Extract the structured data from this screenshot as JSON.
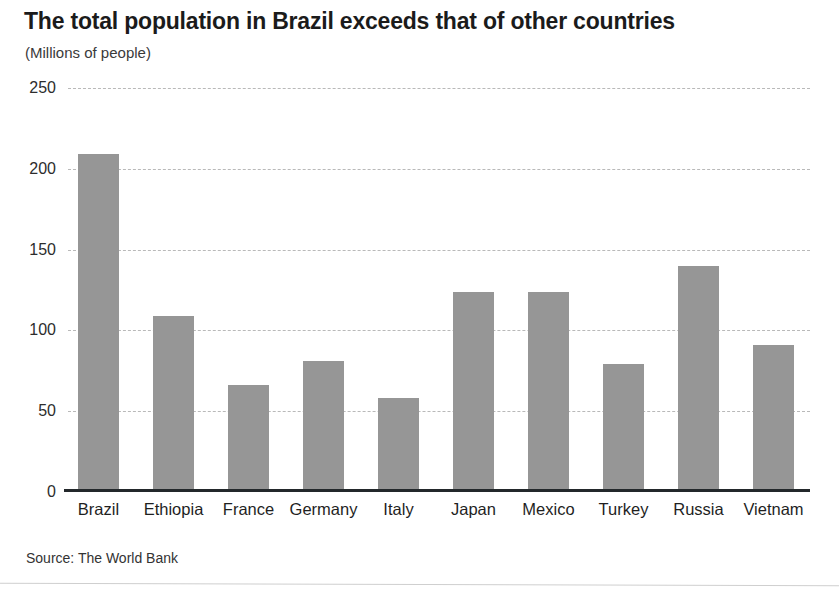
{
  "header": {
    "title": "The total population in Brazil exceeds that of other countries",
    "subtitle": "(Millions of people)"
  },
  "footer": {
    "source": "Source: The World Bank"
  },
  "style": {
    "bar_color": "#969696",
    "axis_color": "#23282b",
    "gridline_color": "#b9b9b9",
    "text_color": "#1b1b1b",
    "background": "#ffffff"
  },
  "chart_data": {
    "type": "bar",
    "title": "The total population in Brazil exceeds that of other countries",
    "subtitle": "(Millions of people)",
    "xlabel": "",
    "ylabel": "Millions of people",
    "ylim": [
      0,
      250
    ],
    "yticks": [
      0,
      50,
      100,
      150,
      200,
      250
    ],
    "ytick_labels": [
      "0",
      "50",
      "100",
      "150",
      "200",
      "250"
    ],
    "grid": true,
    "legend": false,
    "source": "Source: The World Bank",
    "categories": [
      "Brazil",
      "Ethiopia",
      "France",
      "Germany",
      "Italy",
      "Japan",
      "Mexico",
      "Turkey",
      "Russia",
      "Vietnam"
    ],
    "values": [
      209,
      109,
      66,
      81,
      58,
      124,
      124,
      79,
      140,
      91
    ]
  }
}
